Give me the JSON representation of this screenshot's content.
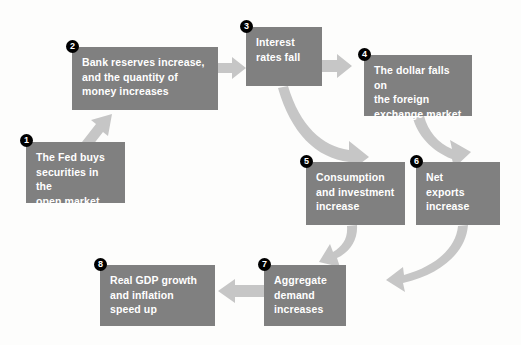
{
  "diagram": {
    "background_color": "#fdfdfc",
    "box_color": "#808080",
    "box_text_color": "#ffffff",
    "arrow_color": "#c6c6c6",
    "badge_color": "#000000",
    "badge_text_color": "#ffffff",
    "nodes": [
      {
        "number": "1",
        "label": "The Fed buys securities in the open market",
        "lines": [
          "The Fed buys",
          "securities in the",
          "open market"
        ],
        "x": 26,
        "y": 142,
        "w": 99,
        "h": 61
      },
      {
        "number": "2",
        "label": "Bank reserves increase, and the quantity of money increases",
        "lines": [
          "Bank reserves increase,",
          "and the quantity of",
          "money increases"
        ],
        "x": 72,
        "y": 47,
        "w": 146,
        "h": 63
      },
      {
        "number": "3",
        "label": "Interest rates fall",
        "lines": [
          "Interest",
          "rates fall"
        ],
        "x": 246,
        "y": 27,
        "w": 76,
        "h": 59
      },
      {
        "number": "4",
        "label": "The dollar falls on the foreign exchange market",
        "lines": [
          "The dollar falls on",
          "the foreign",
          "exchange market"
        ],
        "x": 364,
        "y": 55,
        "w": 108,
        "h": 61
      },
      {
        "number": "5",
        "label": "Consumption and investment increase",
        "lines": [
          "Consumption",
          "and investment",
          "increase"
        ],
        "x": 306,
        "y": 162,
        "w": 99,
        "h": 63
      },
      {
        "number": "6",
        "label": "Net exports increase",
        "lines": [
          "Net",
          "exports",
          "increase"
        ],
        "x": 416,
        "y": 162,
        "w": 84,
        "h": 63
      },
      {
        "number": "7",
        "label": "Aggregate demand increases",
        "lines": [
          "Aggregate",
          "demand",
          "increases"
        ],
        "x": 264,
        "y": 265,
        "w": 82,
        "h": 61
      },
      {
        "number": "8",
        "label": "Real GDP growth and inflation speed up",
        "lines": [
          "Real GDP growth",
          "and inflation",
          "speed up"
        ],
        "x": 100,
        "y": 265,
        "w": 115,
        "h": 61
      }
    ],
    "connections": [
      {
        "from": "1",
        "to": "2",
        "kind": "straight-diagonal-up-right"
      },
      {
        "from": "2",
        "to": "3",
        "kind": "straight-right"
      },
      {
        "from": "3",
        "to": "4",
        "kind": "straight-right"
      },
      {
        "from": "3",
        "to": "5",
        "kind": "curved-down-right"
      },
      {
        "from": "4",
        "to": "6",
        "kind": "curved-down-right"
      },
      {
        "from": "5",
        "to": "7",
        "kind": "curved-down-left"
      },
      {
        "from": "6",
        "to": "7",
        "kind": "curved-down-left"
      },
      {
        "from": "7",
        "to": "8",
        "kind": "straight-left"
      }
    ]
  }
}
